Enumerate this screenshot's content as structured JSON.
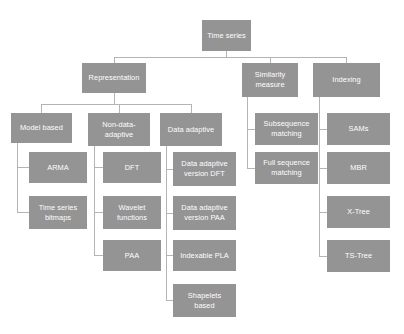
{
  "diagram": {
    "type": "tree-hierarchy",
    "colors": {
      "node_fill": "#949494",
      "node_text": "#ffffff",
      "connector": "#b4b4b4",
      "background": "#ffffff"
    },
    "nodes": [
      {
        "id": "time-series",
        "label": "Time series",
        "x": 202,
        "y": 20,
        "w": 49,
        "h": 31
      },
      {
        "id": "representation",
        "label": "Representation",
        "x": 82,
        "y": 63,
        "w": 64,
        "h": 30
      },
      {
        "id": "similarity-measure",
        "label": "Similarity\nmeasure",
        "x": 242,
        "y": 63,
        "w": 56,
        "h": 34
      },
      {
        "id": "indexing",
        "label": "Indexing",
        "x": 313,
        "y": 63,
        "w": 67,
        "h": 34
      },
      {
        "id": "model-based",
        "label": "Model based",
        "x": 11,
        "y": 113,
        "w": 61,
        "h": 30
      },
      {
        "id": "non-data-adaptive",
        "label": "Non-data-\nadaptive",
        "x": 88,
        "y": 113,
        "w": 62,
        "h": 33
      },
      {
        "id": "data-adaptive",
        "label": "Data adaptive",
        "x": 160,
        "y": 113,
        "w": 62,
        "h": 33
      },
      {
        "id": "subsequence-matching",
        "label": "Subsequence\nmatching",
        "x": 255,
        "y": 113,
        "w": 63,
        "h": 32
      },
      {
        "id": "sams",
        "label": "SAMs",
        "x": 327,
        "y": 113,
        "w": 63,
        "h": 32
      },
      {
        "id": "arma",
        "label": "ARMA",
        "x": 29,
        "y": 152,
        "w": 58,
        "h": 31
      },
      {
        "id": "dft",
        "label": "DFT",
        "x": 103,
        "y": 152,
        "w": 58,
        "h": 31
      },
      {
        "id": "data-adaptive-dft",
        "label": "Data adaptive\nversion DFT",
        "x": 173,
        "y": 152,
        "w": 63,
        "h": 34
      },
      {
        "id": "full-sequence-matching",
        "label": "Full sequence\nmatching",
        "x": 255,
        "y": 152,
        "w": 63,
        "h": 32
      },
      {
        "id": "mbr",
        "label": "MBR",
        "x": 327,
        "y": 152,
        "w": 63,
        "h": 32
      },
      {
        "id": "time-series-bitmaps",
        "label": "Time series\nbitmaps",
        "x": 29,
        "y": 196,
        "w": 58,
        "h": 33
      },
      {
        "id": "wavelet-functions",
        "label": "Wavelet\nfunctions",
        "x": 103,
        "y": 196,
        "w": 58,
        "h": 33
      },
      {
        "id": "data-adaptive-paa",
        "label": "Data adaptive\nversion PAA",
        "x": 173,
        "y": 196,
        "w": 63,
        "h": 34
      },
      {
        "id": "x-tree",
        "label": "X-Tree",
        "x": 327,
        "y": 196,
        "w": 63,
        "h": 32
      },
      {
        "id": "paa",
        "label": "PAA",
        "x": 103,
        "y": 240,
        "w": 58,
        "h": 31
      },
      {
        "id": "indexable-pla",
        "label": "Indexable PLA",
        "x": 173,
        "y": 240,
        "w": 63,
        "h": 31
      },
      {
        "id": "ts-tree",
        "label": "TS-Tree",
        "x": 327,
        "y": 240,
        "w": 63,
        "h": 32
      },
      {
        "id": "shapelets-based",
        "label": "Shapelets\nbased",
        "x": 173,
        "y": 284,
        "w": 63,
        "h": 33
      }
    ],
    "edges": [
      {
        "from": "time-series",
        "to": "representation"
      },
      {
        "from": "time-series",
        "to": "similarity-measure"
      },
      {
        "from": "time-series",
        "to": "indexing"
      },
      {
        "from": "representation",
        "to": "model-based"
      },
      {
        "from": "representation",
        "to": "non-data-adaptive"
      },
      {
        "from": "representation",
        "to": "data-adaptive"
      },
      {
        "from": "model-based",
        "to": "arma"
      },
      {
        "from": "model-based",
        "to": "time-series-bitmaps"
      },
      {
        "from": "non-data-adaptive",
        "to": "dft"
      },
      {
        "from": "non-data-adaptive",
        "to": "wavelet-functions"
      },
      {
        "from": "non-data-adaptive",
        "to": "paa"
      },
      {
        "from": "data-adaptive",
        "to": "data-adaptive-dft"
      },
      {
        "from": "data-adaptive",
        "to": "data-adaptive-paa"
      },
      {
        "from": "data-adaptive",
        "to": "indexable-pla"
      },
      {
        "from": "data-adaptive",
        "to": "shapelets-based"
      },
      {
        "from": "similarity-measure",
        "to": "subsequence-matching"
      },
      {
        "from": "similarity-measure",
        "to": "full-sequence-matching"
      },
      {
        "from": "indexing",
        "to": "sams"
      },
      {
        "from": "indexing",
        "to": "mbr"
      },
      {
        "from": "indexing",
        "to": "x-tree"
      },
      {
        "from": "indexing",
        "to": "ts-tree"
      }
    ]
  }
}
